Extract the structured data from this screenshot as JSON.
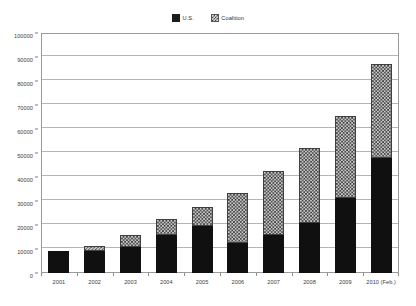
{
  "chart_data": {
    "type": "bar",
    "subtype": "stacked-bar",
    "title": "",
    "xlabel": "",
    "ylabel": "",
    "ylim": [
      0,
      100000
    ],
    "ytick_step": 10000,
    "yticks": [
      "0",
      "10000",
      "20000",
      "30000",
      "40000",
      "50000",
      "60000",
      "70000",
      "80000",
      "90000",
      "100000"
    ],
    "ytick_values": [
      0,
      10000,
      20000,
      30000,
      40000,
      50000,
      60000,
      70000,
      80000,
      90000,
      100000
    ],
    "grid": "horizontal",
    "legend_position": "top-center",
    "categories": [
      "2001",
      "2002",
      "2003",
      "2004",
      "2005",
      "2006",
      "2007",
      "2008",
      "2009",
      "2010 (Feb.)"
    ],
    "series": [
      {
        "name": "U.S.",
        "fill": "solid-black",
        "color": "#101010",
        "values": [
          9200,
          9200,
          10800,
          15800,
          19600,
          12500,
          15800,
          20800,
          31200,
          48000
        ]
      },
      {
        "name": "Coalition",
        "fill": "checkered-hatch",
        "color": "#c9c9c9",
        "values": [
          0,
          2100,
          5000,
          6700,
          7900,
          20800,
          26700,
          31200,
          34300,
          39000
        ]
      }
    ],
    "totals": [
      9200,
      11300,
      15800,
      22500,
      27500,
      33300,
      42500,
      52000,
      65500,
      87000
    ]
  },
  "legend": {
    "entries": [
      {
        "label": "U.S.",
        "swatch": "solid-black-swatch"
      },
      {
        "label": "Coalition",
        "swatch": "hatched-swatch"
      }
    ]
  },
  "caption": {
    "text": ""
  },
  "colors": {
    "us_series": "#101010",
    "coalition_series": "#c9c9c9",
    "gridline": "#b4b4b4",
    "frame": "#9a9a9a",
    "text": "#3d3d3d",
    "background": "#ffffff"
  }
}
